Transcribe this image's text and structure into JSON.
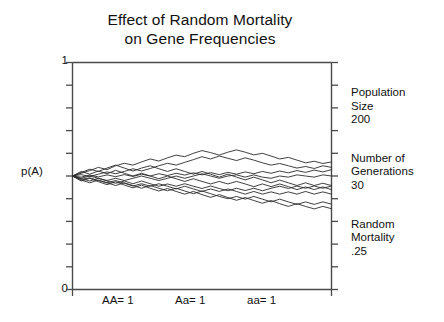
{
  "chart_data": {
    "type": "line",
    "title": "Effect of Random Mortality",
    "title_line2": "on Gene Frequencies",
    "ylabel": "p(A)",
    "xlabel": "",
    "ylim": [
      0,
      1
    ],
    "xlim": [
      0,
      30
    ],
    "y_tick_labels": [
      "1",
      "0"
    ],
    "y_tick_values": [
      0,
      0.1,
      0.2,
      0.3,
      0.4,
      0.5,
      0.6,
      0.7,
      0.8,
      0.9,
      1
    ],
    "x_tick_labels": [
      "AA= 1",
      "Aa= 1",
      "aa= 1"
    ],
    "grid": false,
    "legend": "none",
    "series": [
      {
        "name": "replicate-1",
        "values": [
          0.5,
          0.512,
          0.524,
          0.538,
          0.528,
          0.545,
          0.556,
          0.548,
          0.562,
          0.575,
          0.566,
          0.58,
          0.592,
          0.585,
          0.6,
          0.612,
          0.603,
          0.592,
          0.605,
          0.615,
          0.605,
          0.593,
          0.6,
          0.588,
          0.575,
          0.582,
          0.57,
          0.558,
          0.565,
          0.555,
          0.562
        ]
      },
      {
        "name": "replicate-2",
        "values": [
          0.5,
          0.506,
          0.498,
          0.508,
          0.518,
          0.51,
          0.52,
          0.532,
          0.522,
          0.533,
          0.545,
          0.556,
          0.548,
          0.56,
          0.572,
          0.585,
          0.575,
          0.588,
          0.578,
          0.568,
          0.58,
          0.57,
          0.558,
          0.548,
          0.555,
          0.545,
          0.535,
          0.542,
          0.533,
          0.545,
          0.538
        ]
      },
      {
        "name": "replicate-3",
        "values": [
          0.5,
          0.495,
          0.504,
          0.496,
          0.505,
          0.497,
          0.506,
          0.498,
          0.508,
          0.5,
          0.51,
          0.502,
          0.512,
          0.504,
          0.514,
          0.505,
          0.515,
          0.506,
          0.516,
          0.508,
          0.518,
          0.51,
          0.52,
          0.512,
          0.522,
          0.514,
          0.524,
          0.516,
          0.526,
          0.518,
          0.528
        ]
      },
      {
        "name": "replicate-4",
        "values": [
          0.5,
          0.49,
          0.5,
          0.49,
          0.48,
          0.49,
          0.48,
          0.49,
          0.5,
          0.49,
          0.48,
          0.49,
          0.5,
          0.49,
          0.5,
          0.51,
          0.5,
          0.49,
          0.5,
          0.505,
          0.495,
          0.505,
          0.495,
          0.49,
          0.5,
          0.495,
          0.505,
          0.5,
          0.495,
          0.505,
          0.5
        ]
      },
      {
        "name": "replicate-5",
        "values": [
          0.5,
          0.488,
          0.478,
          0.49,
          0.478,
          0.468,
          0.478,
          0.466,
          0.478,
          0.466,
          0.455,
          0.465,
          0.455,
          0.466,
          0.455,
          0.445,
          0.456,
          0.445,
          0.435,
          0.446,
          0.436,
          0.446,
          0.435,
          0.446,
          0.455,
          0.445,
          0.456,
          0.446,
          0.456,
          0.446,
          0.456
        ]
      },
      {
        "name": "replicate-6",
        "values": [
          0.5,
          0.485,
          0.492,
          0.48,
          0.47,
          0.48,
          0.468,
          0.456,
          0.466,
          0.455,
          0.466,
          0.455,
          0.443,
          0.455,
          0.443,
          0.432,
          0.443,
          0.432,
          0.443,
          0.432,
          0.42,
          0.432,
          0.42,
          0.43,
          0.42,
          0.43,
          0.42,
          0.432,
          0.42,
          0.43,
          0.42
        ]
      },
      {
        "name": "replicate-7",
        "values": [
          0.5,
          0.482,
          0.47,
          0.482,
          0.47,
          0.458,
          0.47,
          0.458,
          0.446,
          0.458,
          0.446,
          0.435,
          0.446,
          0.434,
          0.422,
          0.434,
          0.422,
          0.41,
          0.4,
          0.41,
          0.398,
          0.41,
          0.398,
          0.386,
          0.398,
          0.386,
          0.375,
          0.386,
          0.375,
          0.386,
          0.376
        ]
      },
      {
        "name": "replicate-8",
        "values": [
          0.5,
          0.478,
          0.49,
          0.475,
          0.462,
          0.475,
          0.46,
          0.448,
          0.46,
          0.446,
          0.434,
          0.445,
          0.432,
          0.42,
          0.432,
          0.418,
          0.406,
          0.418,
          0.405,
          0.393,
          0.405,
          0.392,
          0.38,
          0.392,
          0.378,
          0.366,
          0.378,
          0.366,
          0.355,
          0.366,
          0.356
        ]
      },
      {
        "name": "replicate-9",
        "values": [
          0.5,
          0.515,
          0.53,
          0.52,
          0.535,
          0.548,
          0.535,
          0.522,
          0.535,
          0.545,
          0.532,
          0.52,
          0.532,
          0.52,
          0.508,
          0.52,
          0.508,
          0.495,
          0.508,
          0.495,
          0.483,
          0.495,
          0.483,
          0.47,
          0.482,
          0.47,
          0.458,
          0.47,
          0.458,
          0.468,
          0.458
        ]
      },
      {
        "name": "replicate-10",
        "values": [
          0.5,
          0.52,
          0.508,
          0.522,
          0.51,
          0.525,
          0.512,
          0.5,
          0.512,
          0.5,
          0.488,
          0.5,
          0.488,
          0.476,
          0.488,
          0.476,
          0.465,
          0.476,
          0.465,
          0.476,
          0.465,
          0.453,
          0.465,
          0.453,
          0.465,
          0.453,
          0.44,
          0.452,
          0.44,
          0.452,
          0.44
        ]
      }
    ]
  },
  "side_panel": {
    "blocks": [
      {
        "line1": "Population",
        "line2": "Size",
        "line3": "200"
      },
      {
        "line1": "Number of",
        "line2": "Generations",
        "line3": "30"
      },
      {
        "line1": "Random",
        "line2": "Mortality",
        "line3": ".25"
      }
    ]
  },
  "colors": {
    "axis": "#4a4a4a",
    "line": "#2b2b2b",
    "text": "#111111",
    "background": "#ffffff"
  }
}
